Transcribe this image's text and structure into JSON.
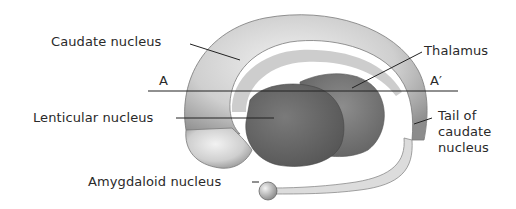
{
  "diagram": {
    "type": "anatomical illustration",
    "labels": {
      "caudate": "Caudate nucleus",
      "thalamus": "Thalamus",
      "section_a": "A",
      "section_a_prime": "A′",
      "lenticular": "Lenticular nucleus",
      "tail_line1": "Tail of",
      "tail_line2": "caudate",
      "tail_line3": "nucleus",
      "amygdaloid": "Amygdaloid nucleus"
    },
    "colors": {
      "caudate_light": "#e8e8e8",
      "caudate_shade": "#9a9a9a",
      "lenticular": "#6a6a6a",
      "thalamus": "#7c7c7c",
      "line": "#222222",
      "text": "#2a2a2a"
    }
  }
}
